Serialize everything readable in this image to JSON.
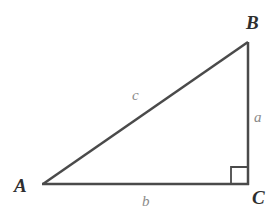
{
  "figure": {
    "kind": "right-triangle-diagram",
    "background_color": "#ffffff",
    "stroke_color": "#4a4a4a",
    "vertex_label_color": "#2e2e2e",
    "side_label_color": "#8a8a8a",
    "stroke_width": 2.5,
    "width": 280,
    "height": 224
  },
  "vertices": {
    "a": {
      "label": "A",
      "x": 43,
      "y": 184
    },
    "b": {
      "label": "B",
      "x": 248,
      "y": 42
    },
    "c": {
      "label": "C",
      "x": 248,
      "y": 184
    }
  },
  "sides": {
    "a": {
      "label": "a",
      "from": "B",
      "to": "C",
      "description": "vertical leg opposite vertex A"
    },
    "b": {
      "label": "b",
      "from": "A",
      "to": "C",
      "description": "horizontal leg opposite vertex B"
    },
    "c": {
      "label": "c",
      "from": "A",
      "to": "B",
      "description": "hypotenuse opposite vertex C"
    }
  },
  "right_angle": {
    "at_vertex": "C",
    "marker_size": 16,
    "marker_x": 231,
    "marker_y": 167
  }
}
